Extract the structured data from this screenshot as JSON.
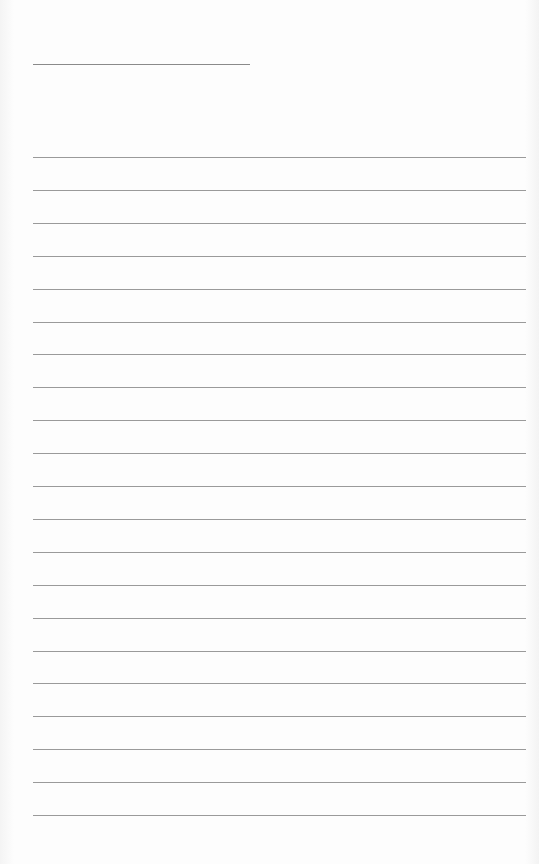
{
  "page": {
    "type": "blank lined notebook paper",
    "background_color": "#fdfdfd",
    "line_color": "#9a9a9a",
    "title_line": {
      "x": 33,
      "y": 64,
      "width": 217
    },
    "rules": {
      "count": 21,
      "x": 33,
      "width": 493,
      "first_y": 157,
      "spacing": 32.9
    }
  }
}
